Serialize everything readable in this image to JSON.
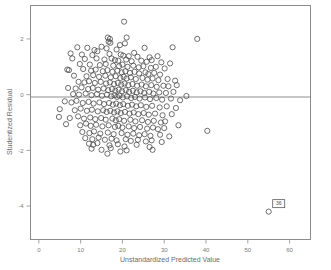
{
  "chart_data": {
    "type": "scatter",
    "title": "",
    "xlabel": "Unstandardized Predicted Value",
    "ylabel": "Studentized Residual",
    "xlim": [
      -2,
      65
    ],
    "ylim": [
      -5.2,
      3.2
    ],
    "xticks": [
      0,
      10,
      20,
      30,
      40,
      50,
      60
    ],
    "xtick_labels": [
      "0",
      "10",
      "20",
      "30",
      "40",
      "50",
      "60"
    ],
    "yticks": [
      2,
      0,
      -2,
      -4
    ],
    "ytick_labels": [
      "2",
      "0",
      "-2",
      "-4"
    ],
    "grid": false,
    "legend": "none",
    "reference_line": {
      "orientation": "horizontal",
      "y": 0
    },
    "marker": {
      "shape": "open-circle",
      "size": 2.6,
      "color": "#4a4a4a"
    },
    "annotations": [
      {
        "label": "36",
        "x": 55.0,
        "y": -4.2,
        "type": "case-number-box"
      }
    ],
    "points": [
      [
        20.4,
        2.62
      ],
      [
        16.5,
        2.05
      ],
      [
        17.0,
        2.0
      ],
      [
        21.0,
        2.05
      ],
      [
        37.9,
        2.0
      ],
      [
        16.7,
        1.9
      ],
      [
        17.1,
        1.86
      ],
      [
        20.6,
        1.84
      ],
      [
        19.4,
        1.78
      ],
      [
        9.2,
        1.7
      ],
      [
        11.6,
        1.68
      ],
      [
        15.0,
        1.72
      ],
      [
        16.2,
        1.66
      ],
      [
        18.6,
        1.62
      ],
      [
        25.3,
        1.68
      ],
      [
        32.0,
        1.7
      ],
      [
        13.3,
        1.6
      ],
      [
        14.0,
        1.56
      ],
      [
        22.8,
        1.5
      ],
      [
        7.6,
        1.48
      ],
      [
        10.3,
        1.44
      ],
      [
        12.8,
        1.42
      ],
      [
        16.9,
        1.46
      ],
      [
        19.6,
        1.44
      ],
      [
        20.2,
        1.4
      ],
      [
        21.5,
        1.38
      ],
      [
        23.6,
        1.36
      ],
      [
        26.5,
        1.34
      ],
      [
        28.4,
        1.38
      ],
      [
        8.0,
        1.3
      ],
      [
        11.0,
        1.28
      ],
      [
        13.8,
        1.3
      ],
      [
        15.7,
        1.26
      ],
      [
        17.4,
        1.3
      ],
      [
        18.2,
        1.24
      ],
      [
        19.0,
        1.22
      ],
      [
        20.9,
        1.26
      ],
      [
        22.2,
        1.2
      ],
      [
        24.5,
        1.22
      ],
      [
        25.8,
        1.18
      ],
      [
        27.0,
        1.24
      ],
      [
        29.3,
        1.16
      ],
      [
        31.4,
        1.12
      ],
      [
        9.8,
        1.1
      ],
      [
        12.2,
        1.08
      ],
      [
        14.6,
        1.06
      ],
      [
        16.0,
        1.1
      ],
      [
        17.8,
        1.04
      ],
      [
        19.2,
        1.02
      ],
      [
        20.0,
        1.08
      ],
      [
        21.2,
        1.0
      ],
      [
        22.6,
        1.04
      ],
      [
        23.9,
        0.98
      ],
      [
        25.0,
        1.02
      ],
      [
        26.8,
        0.96
      ],
      [
        28.0,
        1.0
      ],
      [
        30.1,
        0.94
      ],
      [
        6.8,
        0.9
      ],
      [
        7.2,
        0.88
      ],
      [
        10.6,
        0.92
      ],
      [
        12.5,
        0.86
      ],
      [
        13.6,
        0.9
      ],
      [
        15.3,
        0.84
      ],
      [
        16.4,
        0.88
      ],
      [
        17.6,
        0.82
      ],
      [
        18.8,
        0.86
      ],
      [
        19.8,
        0.8
      ],
      [
        20.7,
        0.84
      ],
      [
        21.8,
        0.78
      ],
      [
        22.9,
        0.82
      ],
      [
        24.0,
        0.76
      ],
      [
        25.5,
        0.8
      ],
      [
        26.2,
        0.74
      ],
      [
        27.6,
        0.78
      ],
      [
        29.0,
        0.72
      ],
      [
        8.4,
        0.68
      ],
      [
        11.4,
        0.66
      ],
      [
        13.0,
        0.7
      ],
      [
        14.4,
        0.64
      ],
      [
        15.9,
        0.68
      ],
      [
        17.2,
        0.62
      ],
      [
        18.4,
        0.66
      ],
      [
        19.5,
        0.6
      ],
      [
        20.3,
        0.64
      ],
      [
        21.0,
        0.58
      ],
      [
        22.0,
        0.62
      ],
      [
        23.2,
        0.56
      ],
      [
        24.8,
        0.6
      ],
      [
        26.0,
        0.54
      ],
      [
        27.2,
        0.58
      ],
      [
        28.6,
        0.52
      ],
      [
        30.8,
        0.56
      ],
      [
        32.6,
        0.5
      ],
      [
        9.5,
        0.46
      ],
      [
        10.9,
        0.44
      ],
      [
        12.0,
        0.48
      ],
      [
        13.4,
        0.42
      ],
      [
        14.8,
        0.46
      ],
      [
        16.1,
        0.4
      ],
      [
        17.0,
        0.44
      ],
      [
        18.0,
        0.38
      ],
      [
        18.9,
        0.42
      ],
      [
        19.7,
        0.36
      ],
      [
        20.5,
        0.4
      ],
      [
        21.4,
        0.34
      ],
      [
        22.4,
        0.38
      ],
      [
        23.5,
        0.32
      ],
      [
        24.6,
        0.36
      ],
      [
        25.6,
        0.3
      ],
      [
        26.9,
        0.34
      ],
      [
        28.2,
        0.28
      ],
      [
        29.8,
        0.32
      ],
      [
        31.0,
        0.3
      ],
      [
        33.0,
        0.34
      ],
      [
        7.0,
        0.24
      ],
      [
        8.8,
        0.22
      ],
      [
        10.2,
        0.26
      ],
      [
        11.8,
        0.2
      ],
      [
        12.9,
        0.24
      ],
      [
        14.2,
        0.18
      ],
      [
        15.5,
        0.22
      ],
      [
        16.6,
        0.16
      ],
      [
        17.5,
        0.2
      ],
      [
        18.3,
        0.14
      ],
      [
        19.1,
        0.18
      ],
      [
        19.9,
        0.12
      ],
      [
        20.8,
        0.16
      ],
      [
        21.6,
        0.1
      ],
      [
        22.5,
        0.14
      ],
      [
        23.4,
        0.08
      ],
      [
        24.3,
        0.12
      ],
      [
        25.2,
        0.06
      ],
      [
        26.4,
        0.1
      ],
      [
        27.4,
        0.04
      ],
      [
        28.8,
        0.08
      ],
      [
        30.4,
        0.06
      ],
      [
        32.2,
        0.1
      ],
      [
        8.2,
        0.02
      ],
      [
        9.6,
        0.0
      ],
      [
        11.2,
        0.04
      ],
      [
        12.6,
        -0.02
      ],
      [
        13.9,
        0.02
      ],
      [
        15.1,
        -0.04
      ],
      [
        16.3,
        0.0
      ],
      [
        17.3,
        -0.06
      ],
      [
        18.1,
        -0.02
      ],
      [
        18.7,
        -0.08
      ],
      [
        19.3,
        -0.04
      ],
      [
        20.1,
        -0.1
      ],
      [
        21.1,
        -0.06
      ],
      [
        22.1,
        -0.12
      ],
      [
        23.0,
        -0.08
      ],
      [
        24.1,
        -0.14
      ],
      [
        25.4,
        -0.1
      ],
      [
        26.6,
        -0.16
      ],
      [
        28.1,
        -0.12
      ],
      [
        29.5,
        -0.18
      ],
      [
        31.6,
        -0.14
      ],
      [
        33.8,
        -0.2
      ],
      [
        35.3,
        -0.05
      ],
      [
        6.2,
        -0.24
      ],
      [
        7.8,
        -0.28
      ],
      [
        9.0,
        -0.22
      ],
      [
        10.5,
        -0.3
      ],
      [
        11.9,
        -0.26
      ],
      [
        13.1,
        -0.32
      ],
      [
        14.5,
        -0.28
      ],
      [
        15.6,
        -0.34
      ],
      [
        16.8,
        -0.3
      ],
      [
        17.7,
        -0.36
      ],
      [
        18.5,
        -0.32
      ],
      [
        19.4,
        -0.38
      ],
      [
        20.2,
        -0.34
      ],
      [
        21.3,
        -0.4
      ],
      [
        22.3,
        -0.36
      ],
      [
        23.3,
        -0.42
      ],
      [
        24.4,
        -0.38
      ],
      [
        25.7,
        -0.44
      ],
      [
        27.1,
        -0.4
      ],
      [
        28.9,
        -0.46
      ],
      [
        30.6,
        -0.42
      ],
      [
        32.8,
        -0.48
      ],
      [
        5.0,
        -0.52
      ],
      [
        8.6,
        -0.56
      ],
      [
        10.0,
        -0.5
      ],
      [
        11.5,
        -0.58
      ],
      [
        12.7,
        -0.54
      ],
      [
        14.1,
        -0.6
      ],
      [
        15.4,
        -0.56
      ],
      [
        16.2,
        -0.62
      ],
      [
        17.1,
        -0.58
      ],
      [
        18.0,
        -0.64
      ],
      [
        18.8,
        -0.6
      ],
      [
        19.6,
        -0.66
      ],
      [
        20.6,
        -0.62
      ],
      [
        21.7,
        -0.68
      ],
      [
        22.7,
        -0.64
      ],
      [
        23.8,
        -0.7
      ],
      [
        25.1,
        -0.66
      ],
      [
        26.3,
        -0.72
      ],
      [
        27.8,
        -0.68
      ],
      [
        29.6,
        -0.74
      ],
      [
        31.8,
        -0.7
      ],
      [
        4.8,
        -0.8
      ],
      [
        7.4,
        -0.84
      ],
      [
        9.4,
        -0.78
      ],
      [
        10.8,
        -0.86
      ],
      [
        12.3,
        -0.82
      ],
      [
        13.5,
        -0.88
      ],
      [
        14.9,
        -0.84
      ],
      [
        16.0,
        -0.9
      ],
      [
        17.6,
        -0.86
      ],
      [
        18.4,
        -0.92
      ],
      [
        19.2,
        -0.88
      ],
      [
        20.4,
        -0.94
      ],
      [
        21.9,
        -0.9
      ],
      [
        23.1,
        -0.96
      ],
      [
        24.7,
        -0.92
      ],
      [
        26.1,
        -0.98
      ],
      [
        27.5,
        -0.94
      ],
      [
        29.2,
        -1.0
      ],
      [
        30.2,
        -0.96
      ],
      [
        33.4,
        -1.1
      ],
      [
        6.5,
        -1.06
      ],
      [
        9.9,
        -1.1
      ],
      [
        11.3,
        -1.04
      ],
      [
        12.4,
        -1.12
      ],
      [
        13.7,
        -1.08
      ],
      [
        15.2,
        -1.14
      ],
      [
        16.7,
        -1.1
      ],
      [
        18.2,
        -1.16
      ],
      [
        19.0,
        -1.12
      ],
      [
        20.0,
        -1.18
      ],
      [
        21.5,
        -1.14
      ],
      [
        22.8,
        -1.2
      ],
      [
        24.2,
        -1.16
      ],
      [
        25.9,
        -1.22
      ],
      [
        27.3,
        -1.18
      ],
      [
        28.5,
        -1.24
      ],
      [
        30.0,
        -1.2
      ],
      [
        40.3,
        -1.3
      ],
      [
        10.4,
        -1.34
      ],
      [
        12.1,
        -1.38
      ],
      [
        13.2,
        -1.32
      ],
      [
        14.7,
        -1.4
      ],
      [
        16.5,
        -1.36
      ],
      [
        17.9,
        -1.42
      ],
      [
        19.8,
        -1.38
      ],
      [
        21.2,
        -1.44
      ],
      [
        22.6,
        -1.4
      ],
      [
        24.0,
        -1.46
      ],
      [
        25.3,
        -1.42
      ],
      [
        26.7,
        -1.48
      ],
      [
        29.0,
        -1.44
      ],
      [
        31.2,
        -1.5
      ],
      [
        11.1,
        -1.56
      ],
      [
        12.8,
        -1.6
      ],
      [
        14.3,
        -1.54
      ],
      [
        15.8,
        -1.62
      ],
      [
        17.4,
        -1.58
      ],
      [
        18.6,
        -1.64
      ],
      [
        20.8,
        -1.6
      ],
      [
        22.0,
        -1.66
      ],
      [
        23.7,
        -1.62
      ],
      [
        25.6,
        -1.68
      ],
      [
        27.0,
        -1.64
      ],
      [
        29.4,
        -1.7
      ],
      [
        12.0,
        -1.76
      ],
      [
        13.0,
        -1.8
      ],
      [
        14.0,
        -1.74
      ],
      [
        16.9,
        -1.82
      ],
      [
        18.9,
        -1.78
      ],
      [
        20.5,
        -1.86
      ],
      [
        23.4,
        -1.8
      ],
      [
        26.5,
        -1.88
      ],
      [
        12.6,
        -1.94
      ],
      [
        15.0,
        -1.98
      ],
      [
        17.2,
        -1.92
      ],
      [
        21.0,
        -2.0
      ],
      [
        27.2,
        -1.98
      ],
      [
        16.4,
        -2.12
      ],
      [
        19.5,
        -2.04
      ],
      [
        55.0,
        -4.2
      ]
    ]
  },
  "axes": {
    "x_title": "Unstandardized Predicted Value",
    "y_title": "Studentized Residual"
  }
}
